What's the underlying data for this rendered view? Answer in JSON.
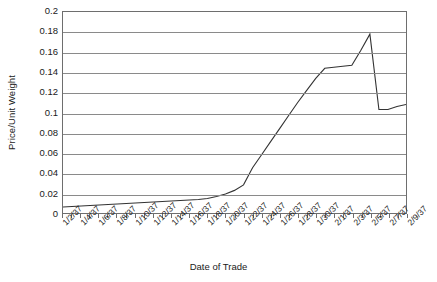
{
  "chart_data": {
    "type": "line",
    "title": "",
    "xlabel": "Date of Trade",
    "ylabel": "Price/Unit Weight",
    "ylim": [
      0,
      0.2
    ],
    "ytick_step": 0.02,
    "grid": true,
    "legend": "none",
    "line_color": "#333333",
    "grid_color": "#8a8a8a",
    "axis_color": "#6e6e6e",
    "ytick_labels": [
      "0.2",
      "0.18",
      "0.16",
      "0.14",
      "0.12",
      "0.1",
      "0.08",
      "0.06",
      "0.04",
      "0.02",
      "0"
    ],
    "ytick_values": [
      0.2,
      0.18,
      0.16,
      0.14,
      0.12,
      0.1,
      0.08,
      0.06,
      0.04,
      0.02,
      0
    ],
    "xtick_labels": [
      "1/2/37",
      "1/4/37",
      "1/6/37",
      "1/8/37",
      "1/10/37",
      "1/12/37",
      "1/14/37",
      "1/16/37",
      "1/18/37",
      "1/20/37",
      "1/22/37",
      "1/24/37",
      "1/26/37",
      "1/28/37",
      "1/30/37",
      "2/1/37",
      "2/3/37",
      "2/5/37",
      "2/7/37",
      "2/9/37"
    ],
    "categories": [
      "1/2/37",
      "1/3/37",
      "1/4/37",
      "1/5/37",
      "1/6/37",
      "1/7/37",
      "1/8/37",
      "1/9/37",
      "1/10/37",
      "1/11/37",
      "1/12/37",
      "1/13/37",
      "1/14/37",
      "1/15/37",
      "1/16/37",
      "1/17/37",
      "1/18/37",
      "1/19/37",
      "1/20/37",
      "1/21/37",
      "1/22/37",
      "1/23/37",
      "1/24/37",
      "1/25/37",
      "1/26/37",
      "1/27/37",
      "1/28/37",
      "1/29/37",
      "1/30/37",
      "1/31/37",
      "2/1/37",
      "2/2/37",
      "2/3/37",
      "2/4/37",
      "2/5/37",
      "2/6/37",
      "2/7/37",
      "2/8/37",
      "2/9/37"
    ],
    "values": [
      0.006,
      0.0065,
      0.007,
      0.0075,
      0.008,
      0.0085,
      0.009,
      0.0095,
      0.01,
      0.0105,
      0.011,
      0.0115,
      0.012,
      0.0125,
      0.013,
      0.0135,
      0.0145,
      0.0165,
      0.019,
      0.0225,
      0.028,
      0.045,
      0.058,
      0.071,
      0.084,
      0.097,
      0.11,
      0.122,
      0.134,
      0.144,
      0.145,
      0.146,
      0.147,
      0.162,
      0.178,
      0.103,
      0.103,
      0.106,
      0.108
    ]
  }
}
